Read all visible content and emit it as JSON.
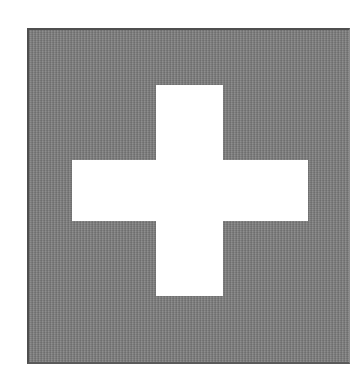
{
  "image": {
    "subject": "white cross on gray square",
    "colors": {
      "background": "#ffffff",
      "square": "#818181",
      "square_border": "#4f4f4f",
      "cross": "#ffffff"
    }
  }
}
